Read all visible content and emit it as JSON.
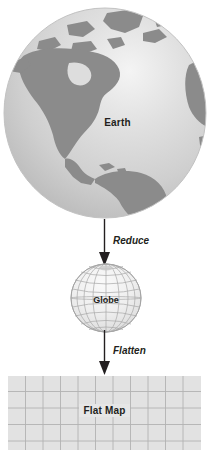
{
  "diagram": {
    "stages": [
      {
        "id": "earth",
        "label": "Earth",
        "icon": "earth-globe-icon"
      },
      {
        "id": "globe",
        "label": "Globe",
        "icon": "wireframe-globe-icon"
      },
      {
        "id": "flat-map",
        "label": "Flat Map",
        "icon": "grid-map-icon"
      }
    ],
    "transitions": [
      {
        "id": "reduce",
        "label": "Reduce",
        "icon": "down-arrow-icon"
      },
      {
        "id": "flatten",
        "label": "Flatten",
        "icon": "down-arrow-icon"
      }
    ]
  },
  "colors": {
    "ocean_light": "#e3e3e3",
    "ocean_mid": "#c9c9c9",
    "land": "#8b8b8b",
    "globe_outline": "#9a9a9a",
    "globe_fill": "#ededed",
    "map_fill": "#e2e2e2",
    "map_grid": "#b5b5b5",
    "text": "#231f20",
    "arrow": "#231f20"
  },
  "map": {
    "columns": 11,
    "rows": 4
  }
}
